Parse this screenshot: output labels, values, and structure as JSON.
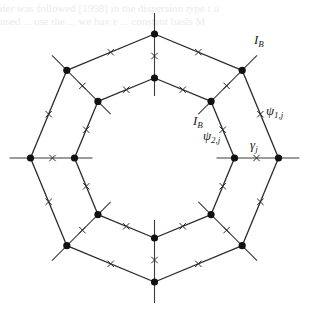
{
  "figure": {
    "ring_count": 2,
    "sides": 8,
    "node_color": "#111111",
    "line_color": "#2a2a2a"
  },
  "labels": {
    "ib_outer": {
      "base": "I",
      "sub": "B"
    },
    "ib_inner": {
      "base": "I",
      "sub": "B"
    },
    "psi_outer": {
      "base": "ψ",
      "sub": "1,j"
    },
    "psi_inner": {
      "base": "ψ",
      "sub": "2,j"
    },
    "gamma": {
      "base": "γ",
      "sub": "j"
    }
  },
  "background_text": [
    "der was followed [1998] in the dispersion type t u",
    "used ... use the ... we hav e ... constant basis  M"
  ]
}
